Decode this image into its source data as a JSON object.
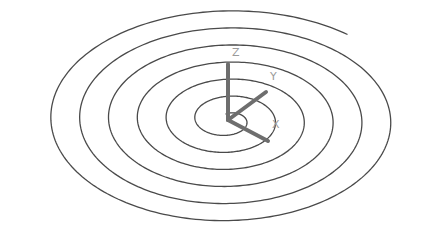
{
  "viewport": {
    "background": "#ffffff",
    "view": "isometric 3D view"
  },
  "spiral": {
    "type": "archimedean spiral (helix projected)",
    "center": [
      228,
      120
    ],
    "turns": 6.5,
    "stroke_color": "#4a4a4a",
    "outer_extent_x": [
      32,
      407
    ],
    "outer_extent_y": [
      18,
      240
    ],
    "end_point": [
      120,
      26
    ]
  },
  "ucs_icon": {
    "origin": [
      228,
      120
    ],
    "axis_color": "#6e6e6e",
    "label_color": "#9a9a9a",
    "axes": [
      {
        "name": "Z",
        "label": "Z",
        "tip": [
          228,
          64
        ],
        "label_pos": [
          232,
          56
        ]
      },
      {
        "name": "Y",
        "label": "Y",
        "tip": [
          266,
          92
        ],
        "label_pos": [
          270,
          80
        ]
      },
      {
        "name": "X",
        "label": "X",
        "tip": [
          268,
          141
        ],
        "label_pos": [
          272,
          128
        ]
      }
    ]
  }
}
